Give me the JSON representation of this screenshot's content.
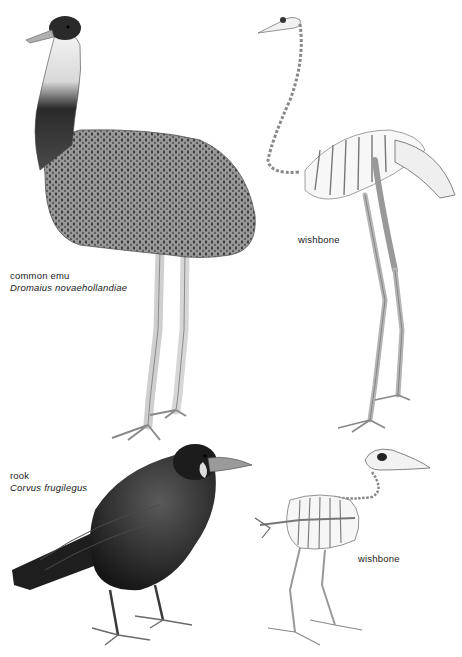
{
  "plate": {
    "background": "#ffffff",
    "specimens": [
      {
        "id": "emu",
        "common_name": "common emu",
        "scientific_name": "Dromaius novaehollandiae",
        "skeleton_label": "wishbone"
      },
      {
        "id": "rook",
        "common_name": "rook",
        "scientific_name": "Corvus frugilegus",
        "skeleton_label": "wishbone"
      }
    ]
  }
}
